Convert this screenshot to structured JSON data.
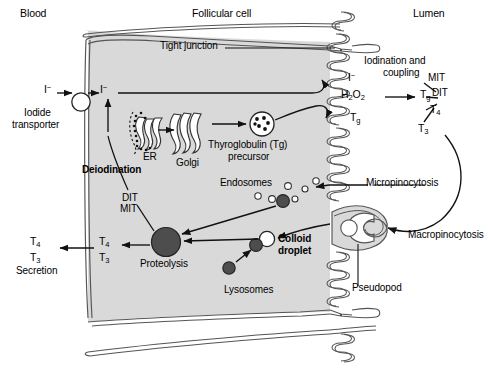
{
  "figure": {
    "title_regions": {
      "blood": "Blood",
      "follicular_cell": "Follicular cell",
      "lumen": "Lumen"
    },
    "labels": {
      "tight_junction": "Tight junction",
      "iodide_transporter_line1": "Iodide",
      "iodide_transporter_line2": "transporter",
      "iodide_blood": "I",
      "iodide_blood_charge": "−",
      "iodide_cell": "I",
      "iodide_cell_charge": "−",
      "iodide_lumen": "I",
      "iodide_lumen_charge": "−",
      "er": "ER",
      "golgi": "Golgi",
      "thyroglobulin_line1": "Thyroglobulin (Tg)",
      "thyroglobulin_line2": "precursor",
      "deiodination": "Deiodination",
      "dit_cell": "DIT",
      "mit_cell": "MIT",
      "endosomes": "Endosomes",
      "micropinocytosis": "Micropinocytosis",
      "macropinocytosis": "Macropinocytosis",
      "pseudopod": "Pseudopod",
      "colloid_line1": "Colloid",
      "colloid_line2": "droplet",
      "lysosomes": "Lysosomes",
      "proteolysis": "Proteolysis",
      "secretion": "Secretion",
      "iodination_line1": "Iodination and",
      "iodination_line2": "coupling",
      "hydrogen_peroxide": "H",
      "hydrogen_peroxide_sub1": "2",
      "hydrogen_peroxide_mid": "O",
      "hydrogen_peroxide_sub2": "2",
      "tg_membrane": "T",
      "tg_membrane_sub": "g",
      "tg_lumen": "T",
      "tg_lumen_sub": "g",
      "mit_lumen": "MIT",
      "dit_lumen": "DIT",
      "t4_lumen": "T",
      "t4_lumen_sub": "4",
      "t3_lumen": "T",
      "t3_lumen_sub": "3",
      "t4_cell": "T",
      "t4_cell_sub": "4",
      "t3_cell": "T",
      "t3_cell_sub": "3",
      "t4_blood": "T",
      "t4_blood_sub": "4",
      "t3_blood": "T",
      "t3_blood_sub": "3"
    },
    "colors": {
      "cytoplasm": "#d9d9d9",
      "membrane_fill": "#e8e8e8",
      "stroke": "#1a1a1a",
      "dark_organelle": "#4d4d4d",
      "white_vesicle": "#ffffff",
      "background": "#ffffff"
    },
    "structures": {
      "iodide_transporter": "white-circle-on-basolateral-membrane",
      "tg_precursor_vesicle": "circle-with-dark-granules",
      "proteolysis_body": "large-dark-circle",
      "colloid_droplet": "white-circle",
      "lysosome_small": "small-dark-circle",
      "microvilli": "coiled-apical-membrane",
      "pseudopod_shape": "c-shaped-apical-extension"
    }
  }
}
